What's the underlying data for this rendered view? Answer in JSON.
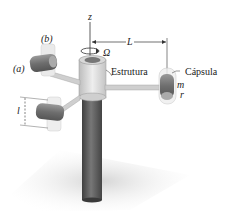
{
  "figure": {
    "labels": {
      "z_axis": "z",
      "omega": "Ω",
      "length_L": "L",
      "frame": "Estrutura",
      "capsule": "Cápsula",
      "mass": "m",
      "radius": "r",
      "position_a": "(a)",
      "position_b": "(b)",
      "length_l": "l"
    },
    "colors": {
      "post_dark": "#555555",
      "frame_light": "#d9d9d9",
      "cylinder": "#8a8a8a",
      "shadow": "#e2e2e2",
      "line": "#333333"
    }
  }
}
